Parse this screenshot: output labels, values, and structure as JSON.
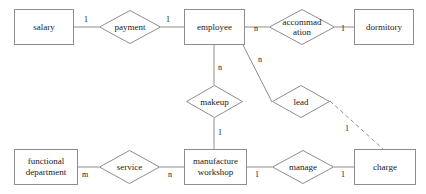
{
  "diagram": {
    "type": "entity-relationship-diagram",
    "title": "",
    "stroke_color": "#8d8d8d",
    "text_color": "#1a1a1a",
    "background_color": "#ffffff",
    "entities": [
      {
        "id": "salary",
        "label": "salary",
        "x": 14,
        "y": 9,
        "w": 60,
        "h": 36
      },
      {
        "id": "employee",
        "label": "employee",
        "x": 184,
        "y": 9,
        "w": 61,
        "h": 36
      },
      {
        "id": "dormitory",
        "label": "dormitory",
        "x": 354,
        "y": 9,
        "w": 60,
        "h": 36
      },
      {
        "id": "functional_department",
        "label": "functional\ndepartment",
        "x": 14,
        "y": 149,
        "w": 64,
        "h": 36
      },
      {
        "id": "manufacture_workshop",
        "label": "manufacture\nworkshop",
        "x": 184,
        "y": 149,
        "w": 63,
        "h": 36
      },
      {
        "id": "charge",
        "label": "charge",
        "x": 354,
        "y": 149,
        "w": 62,
        "h": 36
      }
    ],
    "relationships": [
      {
        "id": "payment",
        "label": "payment",
        "x": 99,
        "y": 10,
        "w": 62,
        "h": 34
      },
      {
        "id": "accommodation",
        "label": "accommad\nation",
        "x": 269,
        "y": 9,
        "w": 66,
        "h": 36
      },
      {
        "id": "makeup",
        "label": "makeup",
        "x": 186,
        "y": 85,
        "w": 57,
        "h": 33
      },
      {
        "id": "lead",
        "label": "lead",
        "x": 272,
        "y": 85,
        "w": 58,
        "h": 33
      },
      {
        "id": "service",
        "label": "service",
        "x": 99,
        "y": 150,
        "w": 61,
        "h": 34
      },
      {
        "id": "manage",
        "label": "manage",
        "x": 272,
        "y": 150,
        "w": 62,
        "h": 34
      }
    ],
    "edges": [
      {
        "id": "salary-payment",
        "from": "salary",
        "to": "payment",
        "x1": 74,
        "y1": 27,
        "x2": 99,
        "y2": 27,
        "style": "solid"
      },
      {
        "id": "payment-employee",
        "from": "payment",
        "to": "employee",
        "x1": 161,
        "y1": 27,
        "x2": 184,
        "y2": 27,
        "style": "solid"
      },
      {
        "id": "employee-accommodation",
        "from": "employee",
        "to": "accommodation",
        "x1": 245,
        "y1": 27,
        "x2": 269,
        "y2": 27,
        "style": "solid"
      },
      {
        "id": "accommodation-dormitory",
        "from": "accommodation",
        "to": "dormitory",
        "x1": 335,
        "y1": 27,
        "x2": 354,
        "y2": 27,
        "style": "solid"
      },
      {
        "id": "employee-makeup",
        "from": "employee",
        "to": "makeup",
        "x1": 214,
        "y1": 45,
        "x2": 214,
        "y2": 85,
        "style": "solid"
      },
      {
        "id": "employee-lead",
        "from": "employee",
        "to": "lead",
        "x1": 243,
        "y1": 45,
        "x2": 272,
        "y2": 102,
        "style": "solid"
      },
      {
        "id": "makeup-manufacture",
        "from": "makeup",
        "to": "manufacture_workshop",
        "x1": 214,
        "y1": 118,
        "x2": 214,
        "y2": 149,
        "style": "solid"
      },
      {
        "id": "lead-charge",
        "from": "lead",
        "to": "charge",
        "x1": 330,
        "y1": 101,
        "x2": 383,
        "y2": 149,
        "style": "dashed"
      },
      {
        "id": "department-service",
        "from": "functional_department",
        "to": "service",
        "x1": 78,
        "y1": 167,
        "x2": 99,
        "y2": 167,
        "style": "solid"
      },
      {
        "id": "service-manufacture",
        "from": "service",
        "to": "manufacture_workshop",
        "x1": 160,
        "y1": 167,
        "x2": 184,
        "y2": 167,
        "style": "solid"
      },
      {
        "id": "manufacture-manage",
        "from": "manufacture_workshop",
        "to": "manage",
        "x1": 247,
        "y1": 167,
        "x2": 272,
        "y2": 167,
        "style": "solid"
      },
      {
        "id": "manage-charge",
        "from": "manage",
        "to": "charge",
        "x1": 334,
        "y1": 167,
        "x2": 354,
        "y2": 167,
        "style": "solid"
      }
    ],
    "cardinalities": [
      {
        "id": "salary-payment-card",
        "edge": "salary-payment",
        "value": "1",
        "x": 84,
        "y": 15
      },
      {
        "id": "payment-employee-card",
        "edge": "payment-employee",
        "value": "1",
        "x": 166,
        "y": 15
      },
      {
        "id": "employee-accommodation-card",
        "edge": "employee-accommodation",
        "value": "n",
        "x": 254,
        "y": 24
      },
      {
        "id": "accommodation-dormitory-card",
        "edge": "accommodation-dormitory",
        "value": "1",
        "x": 341,
        "y": 24
      },
      {
        "id": "employee-makeup-card",
        "edge": "employee-makeup",
        "value": "n",
        "x": 218,
        "y": 63
      },
      {
        "id": "employee-lead-card",
        "edge": "employee-lead",
        "value": "n",
        "x": 258,
        "y": 55
      },
      {
        "id": "makeup-manufacture-card",
        "edge": "makeup-manufacture",
        "value": "1",
        "x": 218,
        "y": 128
      },
      {
        "id": "lead-charge-card",
        "edge": "lead-charge",
        "value": "1",
        "x": 345,
        "y": 124
      },
      {
        "id": "department-service-card",
        "edge": "department-service",
        "value": "m",
        "x": 82,
        "y": 170
      },
      {
        "id": "service-manufacture-card",
        "edge": "service-manufacture",
        "value": "n",
        "x": 168,
        "y": 170
      },
      {
        "id": "manufacture-manage-card",
        "edge": "manufacture-manage",
        "value": "1",
        "x": 255,
        "y": 170
      },
      {
        "id": "manage-charge-card",
        "edge": "manage-charge",
        "value": "1",
        "x": 341,
        "y": 170
      }
    ]
  }
}
